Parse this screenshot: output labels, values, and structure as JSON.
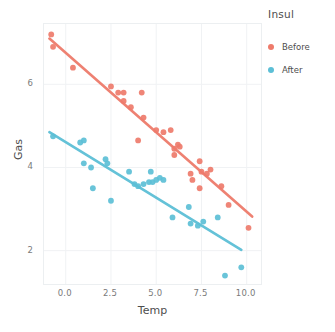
{
  "chart_data": {
    "type": "scatter",
    "title": "",
    "xlabel": "Temp",
    "ylabel": "Gas",
    "xlim": [
      -1.2,
      10.9
    ],
    "ylim": [
      1.15,
      7.45
    ],
    "xticks": [
      "0.0",
      "2.5",
      "5.0",
      "7.5",
      "10.0"
    ],
    "xtick_values": [
      0.0,
      2.5,
      5.0,
      7.5,
      10.0
    ],
    "yticks": [
      "2",
      "4",
      "6"
    ],
    "ytick_values": [
      2,
      4,
      6
    ],
    "grid": true,
    "grid_color": "#f0f2f4",
    "legend": {
      "title": "Insul",
      "position": "right",
      "entries": [
        {
          "label": "Before",
          "color": "#ee7b6b",
          "marker": "circle"
        },
        {
          "label": "After",
          "color": "#5cbfd6",
          "marker": "circle"
        }
      ]
    },
    "series": [
      {
        "name": "Before",
        "color": "#ee7b6b",
        "marker": "circle",
        "points": [
          [
            -0.8,
            7.2
          ],
          [
            -0.7,
            6.9
          ],
          [
            0.4,
            6.4
          ],
          [
            2.5,
            5.95
          ],
          [
            2.9,
            5.8
          ],
          [
            3.2,
            5.8
          ],
          [
            3.2,
            5.6
          ],
          [
            3.6,
            5.45
          ],
          [
            4.0,
            4.65
          ],
          [
            4.2,
            5.8
          ],
          [
            4.3,
            5.2
          ],
          [
            5.0,
            4.9
          ],
          [
            5.4,
            4.85
          ],
          [
            5.8,
            4.9
          ],
          [
            6.0,
            4.45
          ],
          [
            6.0,
            4.3
          ],
          [
            6.2,
            4.55
          ],
          [
            6.3,
            4.5
          ],
          [
            6.9,
            3.85
          ],
          [
            7.0,
            3.7
          ],
          [
            7.4,
            3.5
          ],
          [
            7.4,
            4.15
          ],
          [
            7.5,
            3.9
          ],
          [
            7.8,
            3.85
          ],
          [
            8.0,
            3.95
          ],
          [
            8.6,
            3.55
          ],
          [
            9.0,
            3.1
          ],
          [
            10.1,
            2.55
          ]
        ],
        "fit_line": {
          "x0": -0.9,
          "y0": 7.1,
          "x1": 10.3,
          "y1": 2.82
        }
      },
      {
        "name": "After",
        "color": "#5cbfd6",
        "marker": "circle",
        "points": [
          [
            -0.7,
            4.75
          ],
          [
            0.8,
            4.6
          ],
          [
            1.0,
            4.65
          ],
          [
            1.0,
            4.1
          ],
          [
            1.4,
            4.0
          ],
          [
            1.5,
            3.5
          ],
          [
            2.2,
            4.2
          ],
          [
            2.3,
            4.1
          ],
          [
            2.5,
            3.2
          ],
          [
            3.5,
            3.9
          ],
          [
            3.8,
            3.6
          ],
          [
            4.0,
            3.55
          ],
          [
            4.3,
            3.6
          ],
          [
            4.6,
            3.65
          ],
          [
            4.7,
            3.9
          ],
          [
            4.8,
            3.65
          ],
          [
            5.0,
            3.7
          ],
          [
            5.2,
            3.75
          ],
          [
            5.4,
            3.7
          ],
          [
            5.9,
            2.8
          ],
          [
            6.8,
            3.05
          ],
          [
            6.9,
            2.65
          ],
          [
            7.3,
            2.6
          ],
          [
            7.6,
            2.7
          ],
          [
            8.4,
            2.8
          ],
          [
            8.8,
            1.4
          ],
          [
            9.7,
            1.6
          ]
        ],
        "fit_line": {
          "x0": -0.9,
          "y0": 4.85,
          "x1": 9.7,
          "y1": 2.02
        }
      }
    ]
  }
}
